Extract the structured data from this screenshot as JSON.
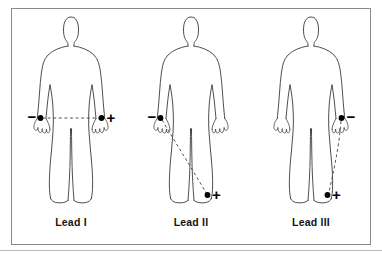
{
  "figure": {
    "frame_color": "#8a8a8a",
    "background_color": "#ffffff",
    "outline_color": "#3a3a3a",
    "electrode_color": "#000000",
    "dashed_line_color": "#555555",
    "bottom_rule_color": "#b9b9b9"
  },
  "panels": [
    {
      "id": "lead-1",
      "label": "Lead I",
      "negative_sign": "−",
      "positive_sign": "+",
      "negative_electrode": "right-arm-wrist",
      "positive_electrode": "left-arm-wrist",
      "vector_path": "horizontal"
    },
    {
      "id": "lead-2",
      "label": "Lead II",
      "negative_sign": "−",
      "positive_sign": "+",
      "negative_electrode": "right-arm-wrist",
      "positive_electrode": "left-leg-ankle",
      "vector_path": "diagonal"
    },
    {
      "id": "lead-3",
      "label": "Lead III",
      "negative_sign": "−",
      "positive_sign": "+",
      "negative_electrode": "left-arm-wrist",
      "positive_electrode": "left-leg-ankle",
      "vector_path": "lateral-descending"
    }
  ]
}
